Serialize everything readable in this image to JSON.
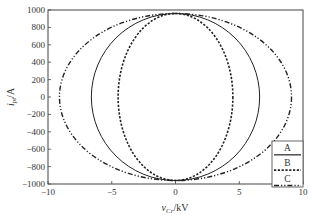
{
  "chart_data": {
    "type": "line",
    "title": "",
    "xlabel": "v_Cr/kV",
    "xlabel_main": "v",
    "xlabel_sub": "Cr",
    "xlabel_unit": "/kV",
    "ylabel": "i_pt/A",
    "ylabel_main": "i",
    "ylabel_sub": "pt",
    "ylabel_unit": "/A",
    "xlim": [
      -10,
      10
    ],
    "ylim": [
      -1000,
      1000
    ],
    "xticks": [
      -10,
      -5,
      0,
      5,
      10
    ],
    "xtick_labels": [
      "−10",
      "−5",
      "0",
      "5",
      "10"
    ],
    "yticks": [
      1000,
      800,
      600,
      400,
      200,
      0,
      -200,
      -400,
      -600,
      -800,
      -1000
    ],
    "ytick_labels": [
      "1000",
      "800",
      "600",
      "400",
      "200",
      "0",
      "−200",
      "−400",
      "−600",
      "−800",
      "−1000"
    ],
    "grid": false,
    "legend_position": "lower right",
    "series": [
      {
        "name": "A",
        "style": "solid",
        "shape": "ellipse",
        "v_amplitude_kV": 6.6,
        "i_amplitude_A": 960
      },
      {
        "name": "B",
        "style": "dotted",
        "shape": "ellipse",
        "v_amplitude_kV": 4.5,
        "i_amplitude_A": 960
      },
      {
        "name": "C",
        "style": "dash-dot",
        "shape": "ellipse",
        "v_amplitude_kV": 9.1,
        "i_amplitude_A": 960
      }
    ]
  }
}
